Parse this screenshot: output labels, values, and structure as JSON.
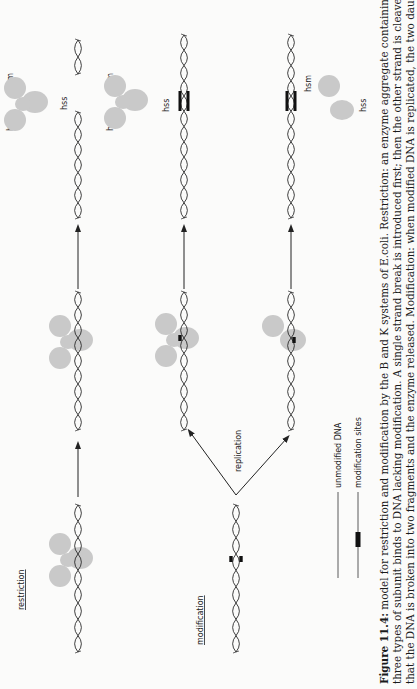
{
  "figure": {
    "orientation": "rotated-90-ccw",
    "sections": {
      "restriction": "restriction",
      "modification": "modification"
    },
    "process_labels": {
      "replication": "replication"
    },
    "subunits": {
      "hsr": "hsr",
      "hsm": "hsm",
      "hss": "hss"
    },
    "legend": {
      "unmodified": "unmodified  DNA",
      "modified": "modification  sites"
    },
    "colors": {
      "enzyme": "#c9c9c9",
      "dna": "#2a2a2a",
      "modification_site": "#111111",
      "background": "#fbfbfa"
    }
  },
  "caption": {
    "label": "Figure 11.4:",
    "lines": [
      " model for restriction and modification by the B and K systems of E.coli. Restriction: an enzyme aggregate containing all",
      "three types of subunit binds to DNA lacking modification. A single strand break is introduced first; then the other strand is cleaved so",
      "that the DNA is broken into two fragments and the enzyme released. Modification: when modified DNA is replicated, the two daughter"
    ]
  }
}
